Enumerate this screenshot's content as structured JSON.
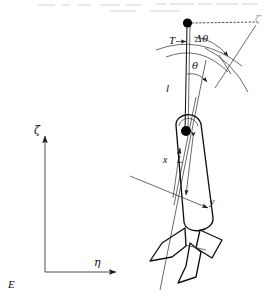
{
  "figure": {
    "background_color": "#ffffff",
    "line_color": "#1a1a1a",
    "width": 271,
    "height": 297
  },
  "labels": {
    "pivot_tension": "T",
    "suspension_length": "l",
    "swing_angle": "θ",
    "angle_increment": "Δθ",
    "body_axis_x": "x",
    "body_axis_y": "y",
    "body_length": "L",
    "earth_axis_vertical": "ζ",
    "earth_axis_horizontal": "η",
    "earth_origin": "E",
    "reference_direction": "ζ′"
  },
  "geometry": {
    "pivot_point": {
      "x": 187,
      "y": 23
    },
    "center_of_mass": {
      "x": 186,
      "y": 131
    },
    "earth_origin_point": {
      "x": 45,
      "y": 272
    },
    "zeta_axis_tip": {
      "x": 45,
      "y": 131
    },
    "eta_axis_tip": {
      "x": 122,
      "y": 272
    },
    "suspension_angle_deg": 8,
    "hull_tilt_deg": 12
  },
  "elements": {
    "pivot_marker": "filled-circle",
    "mass_marker": "filled-circle",
    "dashed_reference_line": "horizontal-dotted",
    "arc_inner": "theta-arc",
    "arc_outer": "delta-theta-arc"
  }
}
